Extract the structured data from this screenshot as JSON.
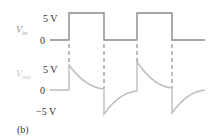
{
  "diagram": {
    "caption": "(b)",
    "input": {
      "symbol": "V",
      "subscript": "in",
      "high_label": "5 V",
      "zero_label": "0",
      "color": "#8a8a8a"
    },
    "output": {
      "symbol": "V",
      "subscript": "out",
      "high_label": "5 V",
      "zero_label": "0",
      "low_label": "−5 V",
      "color": "#bdbdbd"
    },
    "label_color": "#333333",
    "dash_color": "#777777"
  }
}
